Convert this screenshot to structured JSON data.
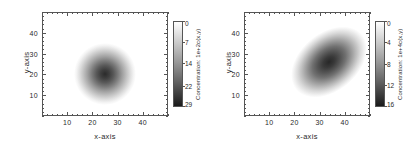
{
  "figure": {
    "background": "#ffffff",
    "panel_count": 2
  },
  "chart_data": [
    {
      "type": "heatmap",
      "panel": "left",
      "title": "",
      "xlabel": "x-axis",
      "ylabel": "y-axis",
      "xlim": [
        0,
        50
      ],
      "ylim": [
        0,
        50
      ],
      "xticks": [
        10,
        20,
        30,
        40
      ],
      "yticks": [
        10,
        20,
        30,
        40
      ],
      "grid": false,
      "colormap": "grayscale-reversed",
      "colorbar": {
        "label": "Concentration: 1e+2c(x,y)",
        "ticks": [
          0,
          7,
          14,
          22,
          29
        ],
        "vmin": 0,
        "vmax": 29,
        "orientation": "vertical",
        "position": "right",
        "top_color": "#ffffff",
        "bottom_color": "#1a1a1a"
      },
      "field": {
        "shape": "isotropic-gaussian",
        "center_x": 25,
        "center_y": 24,
        "sigma_x": 6.2,
        "sigma_y": 6.2,
        "rotation_deg": 0,
        "peak_value": 29
      }
    },
    {
      "type": "heatmap",
      "panel": "right",
      "title": "",
      "xlabel": "x-axis",
      "ylabel": "y-axis",
      "xlim": [
        0,
        50
      ],
      "ylim": [
        0,
        50
      ],
      "xticks": [
        10,
        20,
        30,
        40
      ],
      "yticks": [
        10,
        20,
        30,
        40
      ],
      "grid": false,
      "colormap": "grayscale-reversed",
      "colorbar": {
        "label": "Concentration: 1e+4c(x,y)",
        "ticks": [
          0,
          4,
          8,
          12,
          16
        ],
        "vmin": 0,
        "vmax": 16,
        "orientation": "vertical",
        "position": "right",
        "top_color": "#ffffff",
        "bottom_color": "#1a1a1a"
      },
      "field": {
        "shape": "anisotropic-gaussian",
        "center_x": 31,
        "center_y": 31,
        "sigma_major": 9.5,
        "sigma_minor": 5.8,
        "rotation_deg": 40,
        "peak_value": 16
      }
    }
  ],
  "panels": [
    {
      "id": "left",
      "xaxis": {
        "title": "x-axis",
        "ticks": [
          {
            "value": 10,
            "label": "10"
          },
          {
            "value": 20,
            "label": "20"
          },
          {
            "value": 30,
            "label": "30"
          },
          {
            "value": 40,
            "label": "40"
          }
        ]
      },
      "yaxis": {
        "title": "y-axis",
        "ticks": [
          {
            "value": 10,
            "label": "10"
          },
          {
            "value": 20,
            "label": "20"
          },
          {
            "value": 30,
            "label": "30"
          },
          {
            "value": 40,
            "label": "40"
          }
        ]
      },
      "colorbar": {
        "title": "Concentration: 1e+2c(x,y)",
        "ticks": [
          {
            "value": 0,
            "label": "0"
          },
          {
            "value": 7,
            "label": "7"
          },
          {
            "value": 14,
            "label": "14"
          },
          {
            "value": 22,
            "label": "22"
          },
          {
            "value": 29,
            "label": "29"
          }
        ]
      }
    },
    {
      "id": "right",
      "xaxis": {
        "title": "x-axis",
        "ticks": [
          {
            "value": 10,
            "label": "10"
          },
          {
            "value": 20,
            "label": "20"
          },
          {
            "value": 30,
            "label": "30"
          },
          {
            "value": 40,
            "label": "40"
          }
        ]
      },
      "yaxis": {
        "title": "y-axis",
        "ticks": [
          {
            "value": 10,
            "label": "10"
          },
          {
            "value": 20,
            "label": "20"
          },
          {
            "value": 30,
            "label": "30"
          },
          {
            "value": 40,
            "label": "40"
          }
        ]
      },
      "colorbar": {
        "title": "Concentration: 1e+4c(x,y)",
        "ticks": [
          {
            "value": 0,
            "label": "0"
          },
          {
            "value": 4,
            "label": "4"
          },
          {
            "value": 8,
            "label": "8"
          },
          {
            "value": 12,
            "label": "12"
          },
          {
            "value": 16,
            "label": "16"
          }
        ]
      }
    }
  ]
}
